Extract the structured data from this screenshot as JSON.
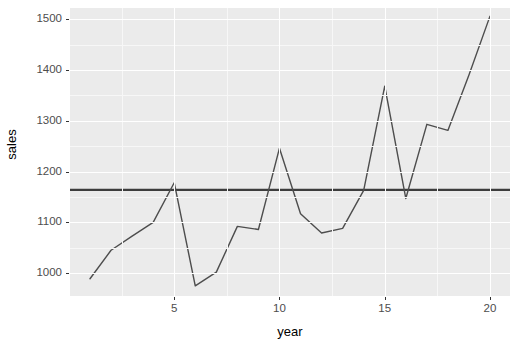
{
  "chart_data": {
    "type": "line",
    "title": "",
    "xlabel": "year",
    "ylabel": "sales",
    "xlim": [
      0.05,
      20.95
    ],
    "ylim": [
      955,
      1522
    ],
    "grid": true,
    "legend": false,
    "x_ticks": [
      5,
      10,
      15,
      20
    ],
    "y_ticks": [
      1000,
      1100,
      1200,
      1300,
      1400,
      1500
    ],
    "x_tick_labels": [
      "5",
      "10",
      "15",
      "20"
    ],
    "y_tick_labels": [
      "1000",
      "1100",
      "1200",
      "1300",
      "1400",
      "1500"
    ],
    "x": [
      1,
      2,
      3,
      4,
      5,
      6,
      7,
      8,
      9,
      10,
      11,
      12,
      13,
      14,
      15,
      16,
      17,
      18,
      19,
      20
    ],
    "series": [
      {
        "name": "sales",
        "type": "line",
        "color": "#4d4d4d",
        "width": 1.4,
        "values": [
          989,
          1045,
          1073,
          1100,
          1178,
          975,
          1002,
          1092,
          1086,
          1246,
          1117,
          1079,
          1088,
          1163,
          1368,
          1147,
          1293,
          1281,
          1390,
          1506
        ]
      }
    ],
    "reference_lines": [
      {
        "name": "mean-sales",
        "orientation": "horizontal",
        "value": 1164,
        "color": "#3d3d3d",
        "width": 2.2
      }
    ],
    "panel_background": "#ebebeb",
    "grid_major_color": "#ffffff",
    "grid_minor_color": "#f7f7f7",
    "axis_text_color": "#4d4d4d",
    "axis_title_color": "#000000"
  },
  "axis": {
    "x_title": "year",
    "y_title": "sales"
  }
}
